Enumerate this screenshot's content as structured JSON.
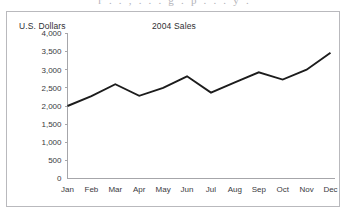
{
  "page": {
    "bleed_text": "r   .   .   ,   .   .   .   g   .   p   .   .   .   y   ."
  },
  "chart_data": {
    "type": "line",
    "title": "2004 Sales",
    "xlabel": "",
    "ylabel": "U.S. Dollars",
    "categories": [
      "Jan",
      "Feb",
      "Mar",
      "Apr",
      "May",
      "Jun",
      "Jul",
      "Aug",
      "Sep",
      "Oct",
      "Nov",
      "Dec"
    ],
    "values": [
      2000,
      2270,
      2600,
      2280,
      2500,
      2820,
      2370,
      2650,
      2930,
      2730,
      3000,
      3470
    ],
    "series": [
      {
        "name": "2004 Sales",
        "values": [
          2000,
          2270,
          2600,
          2280,
          2500,
          2820,
          2370,
          2650,
          2930,
          2730,
          3000,
          3470
        ]
      }
    ],
    "ylim": [
      0,
      4000
    ],
    "ytick_step": 500,
    "ytick_labels": [
      "4,000",
      "3,500",
      "3,000",
      "2,500",
      "2,000",
      "1,500",
      "1,000",
      "500",
      "0"
    ],
    "ytick_values": [
      4000,
      3500,
      3000,
      2500,
      2000,
      1500,
      1000,
      500,
      0
    ],
    "grid": false,
    "legend": "none",
    "line_color": "#1c1c1c",
    "axis_color": "#a6a6aa",
    "text_color": "#3a3a3e"
  }
}
